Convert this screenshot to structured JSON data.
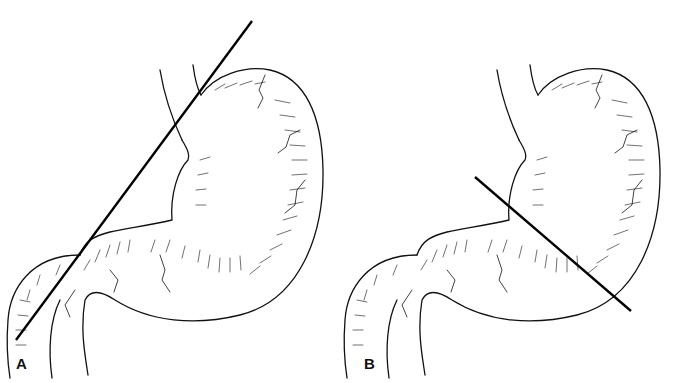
{
  "figure": {
    "panels": [
      {
        "label": "A",
        "description": "Stomach with oblique resection line through upper body toward duodenum"
      },
      {
        "label": "B",
        "description": "Stomach with resection line across lower body/antrum"
      }
    ],
    "caption": ""
  }
}
